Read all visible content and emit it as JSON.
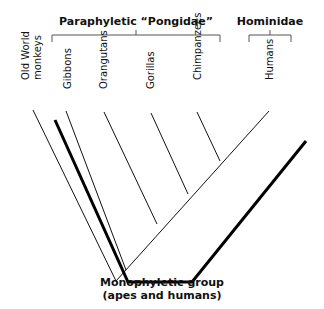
{
  "diagram": {
    "groups": {
      "paraphyletic": {
        "label": "Paraphyletic “Pongidae”"
      },
      "hominidae": {
        "label": "Hominidae"
      }
    },
    "taxa": [
      {
        "line1": "Old World",
        "line2": "monkeys"
      },
      {
        "label": "Gibbons"
      },
      {
        "label": "Orangutans"
      },
      {
        "label": "Gorillas"
      },
      {
        "label": "Chimpanzees"
      },
      {
        "label": "Humans"
      }
    ],
    "caption": {
      "line1": "Monophyletic group",
      "line2": "(apes and humans)"
    },
    "colors": {
      "lines": "#111111",
      "brackets": "#555555",
      "background": "#ffffff"
    }
  }
}
